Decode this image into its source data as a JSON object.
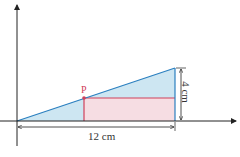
{
  "diagram": {
    "point_label": "P",
    "width_label": "12 cm",
    "height_label": "4 cm",
    "colors": {
      "triangle_fill": "#cde6f2",
      "triangle_stroke": "#2a7fbf",
      "rect_fill": "#f6dde3",
      "rect_stroke": "#d0405a",
      "axis": "#222222"
    }
  }
}
